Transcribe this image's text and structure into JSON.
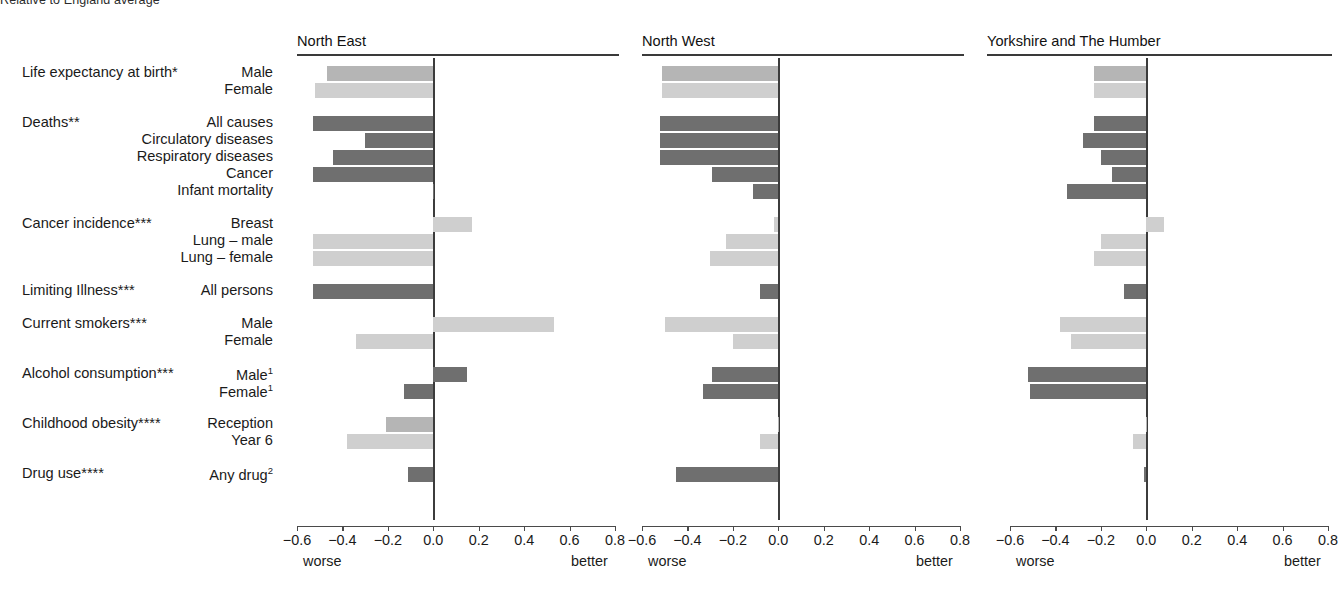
{
  "suptitle": "Relative to England average",
  "axis": {
    "ticks": [
      -0.6,
      -0.4,
      -0.2,
      0.0,
      0.2,
      0.4,
      0.6,
      0.8
    ],
    "tick_labels": [
      "−0.6",
      "−0.4",
      "−0.2",
      "0.0",
      "0.2",
      "0.4",
      "0.6",
      "0.8"
    ],
    "left_end_label": "worse",
    "right_end_label": "better",
    "min": -0.6,
    "max": 0.8
  },
  "groups": [
    {
      "category": "Life expectancy at birth*",
      "rows": [
        {
          "label": "Male",
          "sup": ""
        },
        {
          "label": "Female",
          "sup": ""
        }
      ]
    },
    {
      "category": "Deaths**",
      "rows": [
        {
          "label": "All causes",
          "sup": ""
        },
        {
          "label": "Circulatory diseases",
          "sup": ""
        },
        {
          "label": "Respiratory diseases",
          "sup": ""
        },
        {
          "label": "Cancer",
          "sup": ""
        },
        {
          "label": "Infant mortality",
          "sup": ""
        }
      ]
    },
    {
      "category": "Cancer incidence***",
      "rows": [
        {
          "label": "Breast",
          "sup": ""
        },
        {
          "label": "Lung – male",
          "sup": ""
        },
        {
          "label": "Lung – female",
          "sup": ""
        }
      ]
    },
    {
      "category": "Limiting Illness***",
      "rows": [
        {
          "label": "All persons",
          "sup": ""
        }
      ]
    },
    {
      "category": "Current smokers***",
      "rows": [
        {
          "label": "Male",
          "sup": ""
        },
        {
          "label": "Female",
          "sup": ""
        }
      ]
    },
    {
      "category": "Alcohol consumption***",
      "rows": [
        {
          "label": "Male",
          "sup": "1"
        },
        {
          "label": "Female",
          "sup": "1"
        }
      ]
    },
    {
      "category": "Childhood obesity****",
      "rows": [
        {
          "label": "Reception",
          "sup": ""
        },
        {
          "label": "Year 6",
          "sup": ""
        }
      ]
    },
    {
      "category": "Drug use****",
      "rows": [
        {
          "label": "Any drug",
          "sup": "2"
        }
      ]
    }
  ],
  "colors": {
    "shade_mid": "#b5b5b5",
    "shade_light": "#cfcfcf",
    "shade_dark": "#6f6f6f",
    "axis": "#4a4a4a",
    "rule": "#3a3a3a",
    "text": "#1a1a1a"
  },
  "chart_data": {
    "type": "bar",
    "title": "Relative to England average",
    "orientation": "horizontal",
    "xlabel": "",
    "ylabel": "",
    "xlim": [
      -0.6,
      0.8
    ],
    "xticks": [
      -0.6,
      -0.4,
      -0.2,
      0.0,
      0.2,
      0.4,
      0.6,
      0.8
    ],
    "grid": false,
    "legend": "none",
    "annotations": [
      "worse",
      "better"
    ],
    "categories": [
      "Life expectancy at birth* – Male",
      "Life expectancy at birth* – Female",
      "Deaths** – All causes",
      "Deaths** – Circulatory diseases",
      "Deaths** – Respiratory diseases",
      "Deaths** – Cancer",
      "Deaths** – Infant mortality",
      "Cancer incidence*** – Breast",
      "Cancer incidence*** – Lung – male",
      "Cancer incidence*** – Lung – female",
      "Limiting Illness*** – All persons",
      "Current smokers*** – Male",
      "Current smokers*** – Female",
      "Alcohol consumption*** – Male",
      "Alcohol consumption*** – Female",
      "Childhood obesity**** – Reception",
      "Childhood obesity**** – Year 6",
      "Drug use**** – Any drug"
    ],
    "series": [
      {
        "name": "North East",
        "values": [
          -0.47,
          -0.52,
          -0.53,
          -0.3,
          -0.44,
          -0.53,
          0.0,
          0.17,
          -0.53,
          -0.53,
          -0.53,
          0.53,
          -0.34,
          0.15,
          -0.13,
          -0.21,
          -0.38,
          -0.11
        ]
      },
      {
        "name": "North West",
        "values": [
          -0.51,
          -0.51,
          -0.52,
          -0.52,
          -0.52,
          -0.29,
          -0.11,
          -0.02,
          -0.23,
          -0.3,
          -0.08,
          -0.5,
          -0.2,
          -0.29,
          -0.33,
          0.0,
          -0.08,
          -0.45
        ]
      },
      {
        "name": "Yorkshire and The Humber",
        "values": [
          -0.23,
          -0.23,
          -0.23,
          -0.28,
          -0.2,
          -0.15,
          -0.35,
          0.08,
          -0.2,
          -0.23,
          -0.1,
          -0.38,
          -0.33,
          -0.52,
          -0.51,
          0.0,
          -0.06,
          -0.01
        ]
      }
    ]
  },
  "panels": [
    {
      "title": "North East",
      "bars": [
        {
          "value": -0.47,
          "shade": "mid"
        },
        {
          "value": -0.52,
          "shade": "light"
        },
        {
          "value": -0.53,
          "shade": "dark"
        },
        {
          "value": -0.3,
          "shade": "dark"
        },
        {
          "value": -0.44,
          "shade": "dark"
        },
        {
          "value": -0.53,
          "shade": "dark"
        },
        {
          "value": 0.0,
          "shade": "dark"
        },
        {
          "value": 0.17,
          "shade": "light"
        },
        {
          "value": -0.53,
          "shade": "light"
        },
        {
          "value": -0.53,
          "shade": "light"
        },
        {
          "value": -0.53,
          "shade": "dark"
        },
        {
          "value": 0.53,
          "shade": "light"
        },
        {
          "value": -0.34,
          "shade": "light"
        },
        {
          "value": 0.15,
          "shade": "dark"
        },
        {
          "value": -0.13,
          "shade": "dark"
        },
        {
          "value": -0.21,
          "shade": "mid"
        },
        {
          "value": -0.38,
          "shade": "light"
        },
        {
          "value": -0.11,
          "shade": "dark"
        }
      ]
    },
    {
      "title": "North West",
      "bars": [
        {
          "value": -0.51,
          "shade": "mid"
        },
        {
          "value": -0.51,
          "shade": "light"
        },
        {
          "value": -0.52,
          "shade": "dark"
        },
        {
          "value": -0.52,
          "shade": "dark"
        },
        {
          "value": -0.52,
          "shade": "dark"
        },
        {
          "value": -0.29,
          "shade": "dark"
        },
        {
          "value": -0.11,
          "shade": "dark"
        },
        {
          "value": -0.02,
          "shade": "light"
        },
        {
          "value": -0.23,
          "shade": "light"
        },
        {
          "value": -0.3,
          "shade": "light"
        },
        {
          "value": -0.08,
          "shade": "dark"
        },
        {
          "value": -0.5,
          "shade": "light"
        },
        {
          "value": -0.2,
          "shade": "light"
        },
        {
          "value": -0.29,
          "shade": "dark"
        },
        {
          "value": -0.33,
          "shade": "dark"
        },
        {
          "value": 0.0,
          "shade": "mid"
        },
        {
          "value": -0.08,
          "shade": "light"
        },
        {
          "value": -0.45,
          "shade": "dark"
        }
      ]
    },
    {
      "title": "Yorkshire and The Humber",
      "bars": [
        {
          "value": -0.23,
          "shade": "mid"
        },
        {
          "value": -0.23,
          "shade": "light"
        },
        {
          "value": -0.23,
          "shade": "dark"
        },
        {
          "value": -0.28,
          "shade": "dark"
        },
        {
          "value": -0.2,
          "shade": "dark"
        },
        {
          "value": -0.15,
          "shade": "dark"
        },
        {
          "value": -0.35,
          "shade": "dark"
        },
        {
          "value": 0.08,
          "shade": "light"
        },
        {
          "value": -0.2,
          "shade": "light"
        },
        {
          "value": -0.23,
          "shade": "light"
        },
        {
          "value": -0.1,
          "shade": "dark"
        },
        {
          "value": -0.38,
          "shade": "light"
        },
        {
          "value": -0.33,
          "shade": "light"
        },
        {
          "value": -0.52,
          "shade": "dark"
        },
        {
          "value": -0.51,
          "shade": "dark"
        },
        {
          "value": 0.0,
          "shade": "mid"
        },
        {
          "value": -0.06,
          "shade": "light"
        },
        {
          "value": -0.01,
          "shade": "dark"
        }
      ]
    }
  ]
}
